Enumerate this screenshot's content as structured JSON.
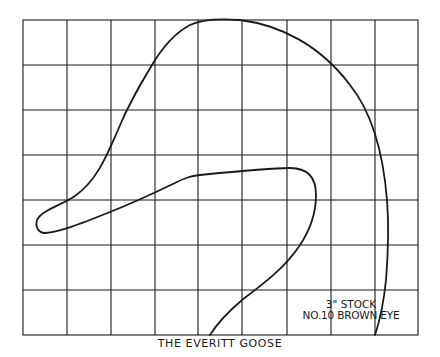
{
  "diagram": {
    "title": "THE EVERITT GOOSE",
    "notes": [
      "3\" STOCK",
      "NO.10 BROWN EYE"
    ],
    "grid": {
      "columns": 9,
      "rows": 7
    },
    "colors": {
      "ink": "#1a1a1a",
      "background": "#ffffff"
    }
  }
}
